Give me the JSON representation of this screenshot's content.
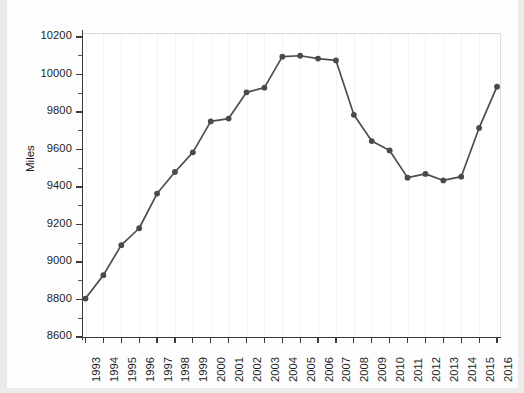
{
  "chart_data": {
    "type": "line",
    "title": "",
    "subtitle": "",
    "xlabel": "",
    "ylabel": "Miles",
    "categories": [
      "1993",
      "1994",
      "1995",
      "1996",
      "1997",
      "1998",
      "1999",
      "2000",
      "2001",
      "2002",
      "2003",
      "2004",
      "2005",
      "2006",
      "2007",
      "2008",
      "2009",
      "2010",
      "2011",
      "2012",
      "2013",
      "2014",
      "2015",
      "2016"
    ],
    "values": [
      8805,
      8930,
      9090,
      9180,
      9365,
      9480,
      9585,
      9750,
      9765,
      9905,
      9930,
      10095,
      10100,
      10085,
      10075,
      9785,
      9645,
      9595,
      9450,
      9470,
      9435,
      9455,
      9715,
      9935
    ],
    "series": [
      {
        "name": "Miles",
        "values": [
          8805,
          8930,
          9090,
          9180,
          9365,
          9480,
          9585,
          9750,
          9765,
          9905,
          9930,
          10095,
          10100,
          10085,
          10075,
          9785,
          9645,
          9595,
          9450,
          9470,
          9435,
          9455,
          9715,
          9935
        ]
      }
    ],
    "ylim": [
      8600,
      10280
    ],
    "xlim": [
      "1993",
      "2016"
    ],
    "y_ticks": [
      8600,
      8800,
      9000,
      9200,
      9400,
      9600,
      9800,
      10000,
      10200
    ],
    "y_tick_labels": [
      "8600",
      "8800",
      "9000",
      "9200",
      "9400",
      "9600",
      "9800",
      "10000",
      "10200"
    ],
    "x_tick_labels": [
      "1993",
      "1994",
      "1995",
      "1996",
      "1997",
      "1998",
      "1999",
      "2000",
      "2001",
      "2002",
      "2003",
      "2004",
      "2005",
      "2006",
      "2007",
      "2008",
      "2009",
      "2010",
      "2011",
      "2012",
      "2013",
      "2014",
      "2015",
      "2016"
    ],
    "grid": false,
    "legend": false,
    "legend_position": "none",
    "marker": "circle",
    "line_color": "#4d4d4d",
    "marker_color": "#4a4a4a",
    "axis_color": "#3a3a3a",
    "background_color": "#ffffff",
    "x_tick_rotation": -90
  },
  "figure": {
    "y_axis_title": "Miles",
    "width": 524,
    "height": 393
  }
}
